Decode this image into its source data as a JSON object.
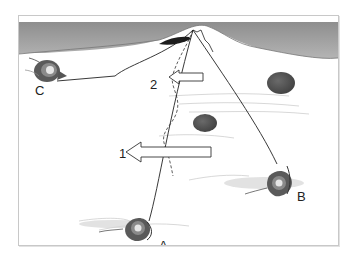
{
  "figure": {
    "labels": {
      "angler_a": "A",
      "angler_b": "B",
      "angler_c": "C",
      "arrow_1": "1",
      "arrow_2": "2"
    },
    "colors": {
      "frame_border": "#c8c8c8",
      "bank": "#9a9a9a",
      "water": "#ffffff",
      "angler": "#555555",
      "rock": "#555555",
      "line": "#222222"
    }
  }
}
